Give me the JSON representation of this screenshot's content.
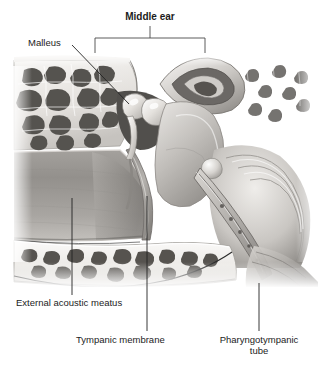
{
  "figure": {
    "title": "Middle ear",
    "style": "grayscale medical illustration",
    "labels": [
      {
        "id": "middle-ear",
        "text": "Middle ear",
        "bold": true,
        "leader": "bracket"
      },
      {
        "id": "malleus",
        "text": "Malleus",
        "bold": false,
        "leader": "diagonal-line"
      },
      {
        "id": "eam",
        "text": "External acoustic meatus",
        "bold": false,
        "leader": "vertical-line"
      },
      {
        "id": "tympanic",
        "text": "Tympanic membrane",
        "bold": false,
        "leader": "vertical-line"
      },
      {
        "id": "pharyngo",
        "text": "Pharyngotympanic tube",
        "bold": false,
        "leader": "vertical-line"
      }
    ],
    "pharyngo_line1": "Pharyngotympanic",
    "pharyngo_line2": "tube",
    "colors": {
      "text": "#1c1c1c",
      "leader": "#222222",
      "bracket": "#555555",
      "bone_light": "#f2f0ee",
      "bone_mid": "#b9b6b2",
      "cavity_dark": "#4a4a4a",
      "soft_tissue": "#8e8e8e",
      "background": "#ffffff"
    },
    "structures": [
      "mastoid air cells",
      "malleus",
      "incus",
      "semicircular canals",
      "cochlea",
      "external acoustic meatus",
      "tympanic membrane",
      "pharyngotympanic tube",
      "temporal bone"
    ]
  }
}
